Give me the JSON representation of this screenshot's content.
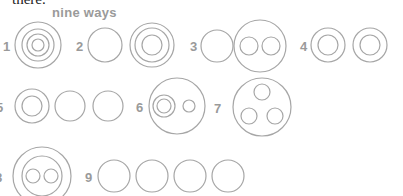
{
  "header": {
    "cutoff_text": "there.",
    "title": "nine ways"
  },
  "colors": {
    "stroke": "#a6a6a6",
    "label": "#9a9a9a"
  },
  "items": [
    {
      "label": "1",
      "description": "four concentric circles"
    },
    {
      "label": "2",
      "description": "single circle and three concentric circles"
    },
    {
      "label": "3",
      "description": "single circle and large circle containing two circles"
    },
    {
      "label": "4",
      "description": "two pairs of concentric circles"
    },
    {
      "label": "5",
      "description": "concentric pair and two single circles"
    },
    {
      "label": "6",
      "description": "large circle containing concentric pair and small circle"
    },
    {
      "label": "7",
      "description": "large circle containing three circles"
    },
    {
      "label": "8",
      "description": "concentric pair containing two small circles"
    },
    {
      "label": "9",
      "description": "four single circles"
    }
  ]
}
